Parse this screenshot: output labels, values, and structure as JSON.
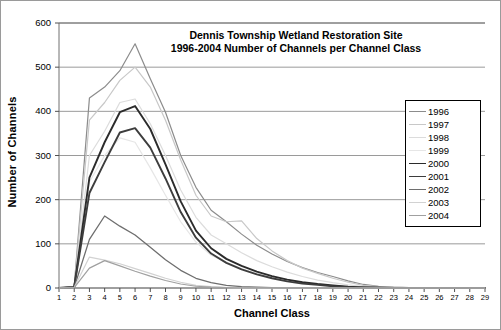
{
  "chart_data": {
    "type": "line",
    "title": "Dennis Township Wetland Restoration Site\n1996-2004 Number of Channels per Channel Class",
    "title_line1": "Dennis Township Wetland Restoration Site",
    "title_line2": "1996-2004 Number of Channels per Channel Class",
    "xlabel": "Channel Class",
    "ylabel": "Number of Channels",
    "xlim": [
      1,
      29
    ],
    "ylim": [
      0,
      600
    ],
    "yticks": [
      0,
      100,
      200,
      300,
      400,
      500,
      600
    ],
    "xticks": [
      1,
      2,
      3,
      4,
      5,
      6,
      7,
      8,
      9,
      10,
      11,
      12,
      13,
      14,
      15,
      16,
      17,
      18,
      19,
      20,
      21,
      22,
      23,
      24,
      25,
      26,
      27,
      28,
      29
    ],
    "grid": "horizontal",
    "legend_position": "right-inside",
    "x": [
      1,
      2,
      3,
      4,
      5,
      6,
      7,
      8,
      9,
      10,
      11,
      12,
      13,
      14,
      15,
      16,
      17,
      18,
      19,
      20,
      21,
      22,
      23,
      24,
      25,
      26,
      27,
      28,
      29
    ],
    "series": [
      {
        "name": "1996",
        "color": "#8c8c8c",
        "width": 1.2,
        "values": [
          0,
          4,
          430,
          455,
          492,
          553,
          474,
          398,
          300,
          228,
          176,
          150,
          122,
          97,
          77,
          60,
          46,
          35,
          26,
          16,
          8,
          4,
          2,
          1,
          1,
          0,
          0,
          0,
          0
        ]
      },
      {
        "name": "1997",
        "color": "#c8c8c8",
        "width": 1.2,
        "values": [
          0,
          3,
          380,
          420,
          470,
          500,
          455,
          380,
          290,
          210,
          163,
          150,
          152,
          112,
          84,
          62,
          45,
          33,
          22,
          13,
          6,
          3,
          2,
          1,
          0,
          0,
          0,
          0,
          0
        ]
      },
      {
        "name": "1998",
        "color": "#dcdcdc",
        "width": 1.2,
        "values": [
          0,
          2,
          300,
          355,
          420,
          428,
          372,
          300,
          222,
          160,
          120,
          100,
          80,
          62,
          48,
          36,
          26,
          18,
          12,
          7,
          3,
          2,
          1,
          0,
          0,
          0,
          0,
          0,
          0
        ]
      },
      {
        "name": "1999",
        "color": "#e6e6e6",
        "width": 1.2,
        "values": [
          0,
          2,
          240,
          300,
          340,
          330,
          272,
          210,
          150,
          104,
          74,
          58,
          44,
          33,
          24,
          17,
          12,
          8,
          5,
          3,
          1,
          1,
          0,
          0,
          0,
          0,
          0,
          0,
          0
        ]
      },
      {
        "name": "2000",
        "color": "#2b2b2b",
        "width": 1.9,
        "values": [
          0,
          2,
          250,
          330,
          398,
          412,
          360,
          280,
          196,
          130,
          90,
          66,
          50,
          37,
          27,
          19,
          13,
          9,
          6,
          3,
          1,
          1,
          0,
          0,
          0,
          0,
          0,
          0,
          0
        ]
      },
      {
        "name": "2001",
        "color": "#3d3d3d",
        "width": 1.9,
        "values": [
          0,
          2,
          215,
          285,
          352,
          362,
          318,
          248,
          172,
          114,
          78,
          57,
          42,
          31,
          22,
          15,
          10,
          7,
          4,
          2,
          1,
          0,
          0,
          0,
          0,
          0,
          0,
          0,
          0
        ]
      },
      {
        "name": "2002",
        "color": "#6e6e6e",
        "width": 1.3,
        "values": [
          0,
          1,
          110,
          163,
          140,
          120,
          92,
          64,
          40,
          22,
          12,
          6,
          3,
          2,
          1,
          0,
          0,
          0,
          0,
          0,
          0,
          0,
          0,
          0,
          0,
          0,
          0,
          0,
          0
        ]
      },
      {
        "name": "2003",
        "color": "#d2d2d2",
        "width": 1.2,
        "values": [
          0,
          1,
          70,
          63,
          55,
          44,
          33,
          22,
          13,
          6,
          3,
          1,
          0,
          0,
          0,
          0,
          0,
          0,
          0,
          0,
          0,
          0,
          0,
          0,
          0,
          0,
          0,
          0,
          0
        ]
      },
      {
        "name": "2004",
        "color": "#a0a0a0",
        "width": 1.2,
        "values": [
          0,
          1,
          45,
          62,
          50,
          38,
          27,
          17,
          9,
          4,
          2,
          1,
          0,
          0,
          0,
          0,
          0,
          0,
          0,
          0,
          0,
          0,
          0,
          0,
          0,
          0,
          0,
          0,
          0
        ]
      }
    ]
  }
}
